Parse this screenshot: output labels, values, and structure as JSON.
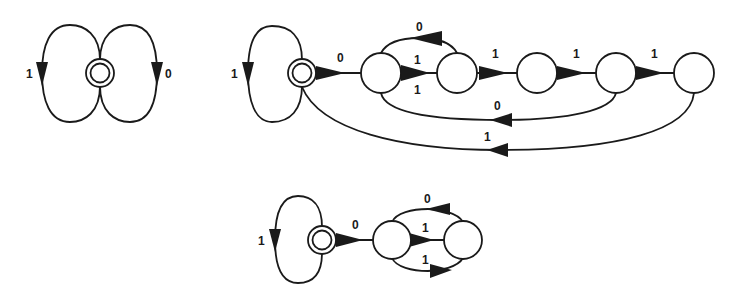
{
  "diagrams": [
    {
      "name": "automaton-1",
      "start_state": {
        "cx": 100,
        "cy": 73
      },
      "loops": [
        {
          "side": "left",
          "label": "1"
        },
        {
          "side": "right",
          "label": "0"
        }
      ]
    },
    {
      "name": "automaton-2",
      "start_state": {
        "cx": 302,
        "cy": 73
      },
      "self_loop_label": "1",
      "states": [
        {
          "cx": 381,
          "cy": 73
        },
        {
          "cx": 457,
          "cy": 73
        },
        {
          "cx": 537,
          "cy": 73
        },
        {
          "cx": 616,
          "cy": 73
        },
        {
          "cx": 694,
          "cy": 73
        }
      ],
      "labels": {
        "start_to_s1": "0",
        "s2_to_s1_top": "0",
        "s1_to_s2_above": "1",
        "s1_to_s2_below": "1",
        "s2_to_s3": "1",
        "s3_to_s4": "1",
        "s4_to_s5": "1",
        "s4_to_s1_back": "0",
        "s5_to_start_back": "1"
      }
    },
    {
      "name": "automaton-3",
      "start_state": {
        "cx": 322,
        "cy": 240
      },
      "self_loop_label": "1",
      "states": [
        {
          "cx": 392,
          "cy": 240
        },
        {
          "cx": 463,
          "cy": 240
        }
      ],
      "labels": {
        "start_to_s1": "0",
        "s2_to_s1_top": "0",
        "s1_to_s2_middle": "1",
        "s1_to_s2_bottom": "1"
      }
    }
  ]
}
